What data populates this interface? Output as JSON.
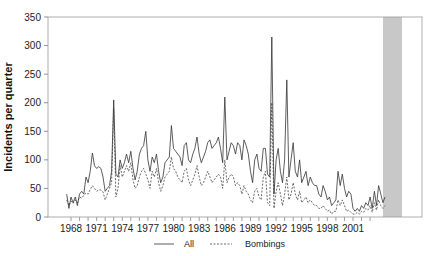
{
  "chart_data": {
    "type": "line",
    "title": "",
    "xlabel": "",
    "ylabel": "Incidents per quarter",
    "ylim": [
      0,
      350
    ],
    "yticks": [
      0,
      50,
      100,
      150,
      200,
      250,
      300,
      350
    ],
    "xticks": [
      "1968",
      "1971",
      "1974",
      "1977",
      "1980",
      "1983",
      "1986",
      "1989",
      "1992",
      "1995",
      "1998",
      "2001"
    ],
    "grid": false,
    "legend_position": "bottom",
    "shaded_region": {
      "start": 2002.0,
      "end": 2003.75,
      "color": "#c8c8c8"
    },
    "x_start": 1967.5,
    "x_step": 0.25,
    "series": [
      {
        "name": "All",
        "style": "solid",
        "values": [
          40,
          15,
          35,
          25,
          35,
          20,
          40,
          45,
          40,
          70,
          60,
          80,
          112,
          90,
          85,
          88,
          85,
          70,
          45,
          50,
          55,
          80,
          205,
          75,
          70,
          100,
          85,
          95,
          110,
          95,
          115,
          85,
          65,
          80,
          110,
          120,
          125,
          150,
          100,
          80,
          105,
          95,
          110,
          80,
          60,
          70,
          95,
          100,
          105,
          160,
          120,
          115,
          110,
          105,
          90,
          125,
          130,
          100,
          95,
          110,
          120,
          140,
          110,
          95,
          105,
          115,
          130,
          135,
          120,
          125,
          130,
          140,
          120,
          95,
          210,
          100,
          115,
          130,
          125,
          110,
          130,
          125,
          100,
          135,
          125,
          110,
          80,
          60,
          100,
          110,
          85,
          80,
          120,
          120,
          75,
          70,
          315,
          40,
          100,
          120,
          80,
          60,
          100,
          240,
          70,
          100,
          130,
          80,
          70,
          100,
          60,
          70,
          80,
          55,
          70,
          60,
          55,
          55,
          40,
          35,
          55,
          45,
          30,
          35,
          20,
          25,
          30,
          80,
          55,
          75,
          50,
          35,
          45,
          40,
          15,
          10,
          15,
          10,
          20,
          15,
          25,
          20,
          35,
          15,
          45,
          20,
          55,
          40,
          25,
          35
        ]
      },
      {
        "name": "Bombings",
        "style": "dashed",
        "values": [
          30,
          20,
          28,
          24,
          30,
          25,
          35,
          33,
          38,
          42,
          40,
          48,
          55,
          50,
          45,
          48,
          47,
          44,
          30,
          40,
          50,
          60,
          190,
          35,
          50,
          90,
          70,
          80,
          90,
          80,
          95,
          65,
          50,
          55,
          70,
          80,
          85,
          75,
          65,
          50,
          80,
          70,
          85,
          60,
          45,
          55,
          70,
          75,
          80,
          105,
          85,
          80,
          70,
          65,
          60,
          80,
          85,
          65,
          55,
          65,
          75,
          90,
          70,
          55,
          60,
          70,
          80,
          70,
          60,
          65,
          70,
          75,
          70,
          50,
          100,
          60,
          70,
          75,
          70,
          55,
          60,
          55,
          40,
          55,
          45,
          40,
          30,
          25,
          45,
          50,
          35,
          30,
          70,
          80,
          25,
          20,
          200,
          15,
          45,
          60,
          40,
          20,
          40,
          70,
          30,
          40,
          60,
          40,
          30,
          45,
          25,
          30,
          35,
          25,
          30,
          25,
          20,
          20,
          15,
          15,
          20,
          15,
          10,
          12,
          5,
          10,
          10,
          30,
          20,
          30,
          20,
          10,
          12,
          8,
          5,
          5,
          8,
          5,
          10,
          8,
          15,
          12,
          20,
          8,
          25,
          12,
          30,
          20,
          15,
          20
        ]
      }
    ]
  },
  "legend": {
    "all_label": "All",
    "bombings_label": "Bombings"
  },
  "axis": {
    "ylabel": "Incidents per quarter"
  }
}
